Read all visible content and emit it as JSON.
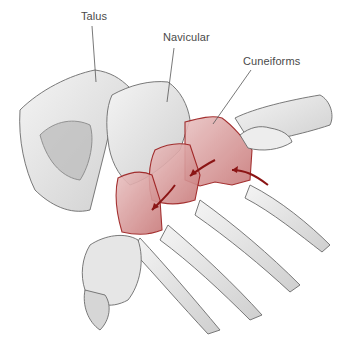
{
  "figure": {
    "labels": [
      {
        "text": "Talus",
        "x": 81,
        "y": 10
      },
      {
        "text": "Navicular",
        "x": 163,
        "y": 31
      },
      {
        "text": "Cuneiforms",
        "x": 243,
        "y": 55
      }
    ],
    "leader_lines": [
      {
        "for": "Talus",
        "x1": 92,
        "y1": 26,
        "x2": 96,
        "y2": 82
      },
      {
        "for": "Navicular",
        "x1": 174,
        "y1": 48,
        "x2": 167,
        "y2": 102
      },
      {
        "for": "Cuneiforms",
        "x1": 251,
        "y1": 70,
        "x2": 213,
        "y2": 124
      }
    ],
    "colors": {
      "bone_line": "#6b6b6b",
      "bone_shade": "#d9d9d9",
      "highlight_fill": "#d9a0a0",
      "highlight_line": "#9b1b1b",
      "label_text": "#4a4a4a",
      "leader": "#555555"
    }
  }
}
